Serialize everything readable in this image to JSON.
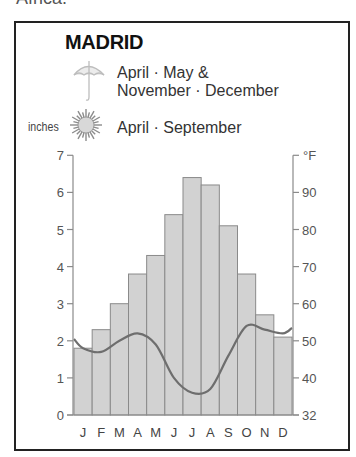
{
  "page": {
    "top_text": "Africa."
  },
  "header": {
    "title": "MADRID",
    "legend": [
      {
        "icon": "umbrella-icon",
        "lines": [
          "April · May &",
          "November · December"
        ]
      },
      {
        "icon": "sun-icon",
        "lines": [
          "April · September"
        ]
      }
    ],
    "left_unit": "inches",
    "right_unit": "°F"
  },
  "colors": {
    "bar_fill": "#d2d2d2",
    "bar_stroke": "#8a8a8a",
    "line": "#6e6e6e",
    "axis": "#8a8a8a",
    "frame": "#222222"
  },
  "chart_data": {
    "type": "bar",
    "title": "MADRID",
    "categories": [
      "J",
      "F",
      "M",
      "A",
      "M",
      "J",
      "J",
      "A",
      "S",
      "O",
      "N",
      "D"
    ],
    "series": [
      {
        "name": "Average high temperature (°F)",
        "type": "bar",
        "axis": "right",
        "values": [
          48,
          53,
          60,
          68,
          73,
          84,
          94,
          92,
          81,
          68,
          57,
          51
        ]
      },
      {
        "name": "Precipitation (inches)",
        "type": "line",
        "axis": "left",
        "values": [
          1.8,
          1.7,
          2.0,
          2.2,
          1.9,
          1.0,
          0.6,
          0.7,
          1.6,
          2.4,
          2.3,
          2.2
        ]
      }
    ],
    "left_axis": {
      "label": "inches",
      "ticks": [
        0,
        1,
        2,
        3,
        4,
        5,
        6,
        7
      ],
      "ylim": [
        0,
        7
      ]
    },
    "right_axis": {
      "label": "°F",
      "ticks": [
        32,
        40,
        50,
        60,
        70,
        80,
        90
      ]
    },
    "xlabel": "",
    "grid": false,
    "legend_position": "top"
  }
}
